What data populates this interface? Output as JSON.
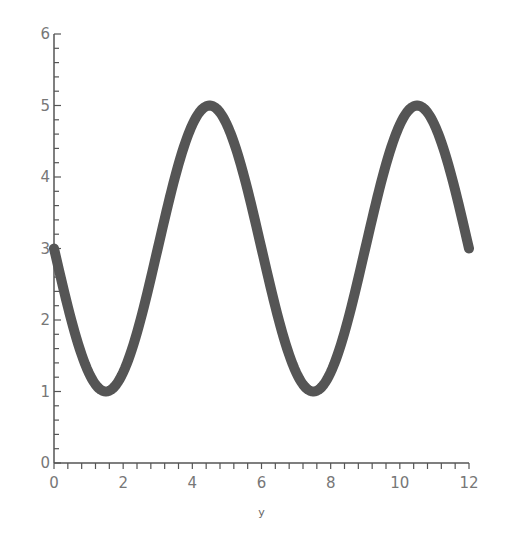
{
  "chart_data": {
    "type": "line",
    "title": "",
    "xlabel": "y",
    "ylabel": "",
    "xlim": [
      0,
      12
    ],
    "ylim": [
      0,
      6
    ],
    "xticks": [
      0,
      2,
      4,
      6,
      8,
      10,
      12
    ],
    "yticks": [
      0,
      1,
      2,
      3,
      4,
      5,
      6
    ],
    "x_minor_step": 0.4,
    "y_minor_step": 0.2,
    "grid": false,
    "legend": null,
    "series": [
      {
        "name": "curve",
        "formula": "3 - 2*sin(pi*x/3)",
        "color": "#555555",
        "x": [
          0,
          0.5,
          1,
          1.5,
          2,
          2.5,
          3,
          3.5,
          4,
          4.5,
          5,
          5.5,
          6,
          6.5,
          7,
          7.5,
          8,
          8.5,
          9,
          9.5,
          10,
          10.5,
          11,
          11.5,
          12
        ],
        "values": [
          3,
          2,
          1.27,
          1,
          1.27,
          2,
          3,
          4,
          4.73,
          5,
          4.73,
          4,
          3,
          2,
          1.27,
          1,
          1.27,
          2,
          3,
          4,
          4.73,
          5,
          4.73,
          4,
          3
        ]
      }
    ]
  }
}
